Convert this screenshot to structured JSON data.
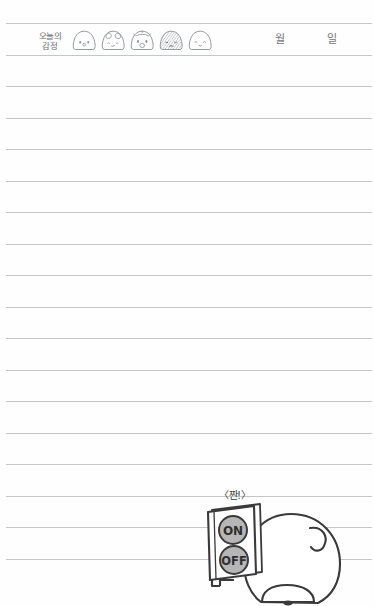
{
  "page": {
    "kind": "lined-diary-page",
    "background_color": "#fefefe",
    "rule_color": "#b9bcc2",
    "rule_count": 18,
    "rule_spacing_px": 31.5,
    "first_rule_y": 23
  },
  "header": {
    "mood_label": "오늘의\n감정",
    "mood_label_romanized": "oneul-ui gamjeong",
    "faces": [
      {
        "name": "face-neutral",
        "expression": "neutral",
        "mouth": "small-o",
        "shaded": false
      },
      {
        "name": "face-sleepy",
        "expression": "sleepy",
        "mouth": "wavy",
        "shaded": false
      },
      {
        "name": "face-surprised",
        "expression": "surprised",
        "mouth": "open",
        "shaded": false
      },
      {
        "name": "face-gloomy",
        "expression": "gloomy",
        "mouth": "flat",
        "shaded": true
      },
      {
        "name": "face-happy",
        "expression": "happy",
        "mouth": "smile",
        "shaded": false
      }
    ],
    "date": {
      "month_unit": "월",
      "day_unit": "일"
    }
  },
  "illustration": {
    "name": "character-with-on-off-panel",
    "speech_text": "〈짠!〉",
    "panel": {
      "buttons": [
        {
          "label": "ON",
          "fill": "#b6b6b6"
        },
        {
          "label": "OFF",
          "fill": "#b6b6b6"
        }
      ]
    },
    "character": {
      "description": "round-headed character seen from behind holding a panel",
      "blush": true,
      "ear": true
    }
  },
  "colors": {
    "ink": "#3a3a3a",
    "rule": "#b9bcc2",
    "text_gray": "#6d707a",
    "button_fill": "#b6b6b6",
    "blush": "#dcdcdc"
  }
}
